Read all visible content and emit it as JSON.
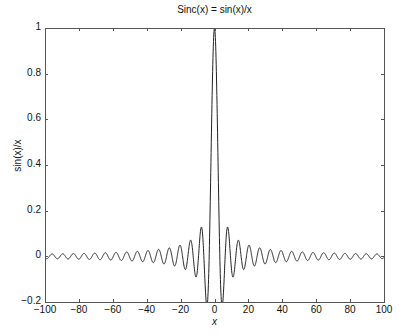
{
  "chart_data": {
    "type": "line",
    "title": "Sinc(x) = sin(x)/x",
    "xlabel": "x",
    "ylabel": "sin(x)/x",
    "xlim": [
      -100,
      100
    ],
    "ylim": [
      -0.2,
      1
    ],
    "xticks": [
      -100,
      -80,
      -60,
      -40,
      -20,
      0,
      20,
      40,
      60,
      80,
      100
    ],
    "xtick_labels": [
      "−100",
      "−80",
      "−60",
      "−40",
      "−20",
      "0",
      "20",
      "40",
      "60",
      "80",
      "100"
    ],
    "yticks": [
      -0.2,
      0,
      0.2,
      0.4,
      0.6,
      0.8,
      1
    ],
    "ytick_labels": [
      "−0.2",
      "0",
      "0.2",
      "0.4",
      "0.6",
      "0.8",
      "1"
    ],
    "grid": false,
    "legend": null,
    "box": true,
    "series": [
      {
        "name": "sin(x)/x",
        "function": "sin(x)/x",
        "x_start": -100,
        "x_end": 100,
        "samples": 2001,
        "color": "#222222",
        "key_points": [
          {
            "x": 0,
            "y": 1.0
          },
          {
            "x": -4.49,
            "y": -0.217
          },
          {
            "x": 4.49,
            "y": -0.217
          },
          {
            "x": -7.73,
            "y": 0.128
          },
          {
            "x": 7.73,
            "y": 0.128
          },
          {
            "x": -10.9,
            "y": -0.091
          },
          {
            "x": 10.9,
            "y": -0.091
          },
          {
            "x": -100,
            "y": 0.005
          },
          {
            "x": 100,
            "y": 0.005
          }
        ]
      }
    ]
  },
  "plot_area": {
    "left": 45,
    "top": 28,
    "right": 384,
    "bottom": 302
  },
  "colors": {
    "axes": "#555555",
    "line": "#222222",
    "text": "#111111"
  }
}
